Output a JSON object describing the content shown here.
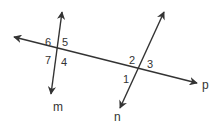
{
  "diagram": {
    "type": "transversal-lines",
    "lines": [
      {
        "name": "m",
        "label": "m"
      },
      {
        "name": "n",
        "label": "n"
      },
      {
        "name": "p",
        "label": "p"
      }
    ],
    "angles": {
      "a1": "1",
      "a2": "2",
      "a3": "3",
      "a4": "4",
      "a5": "5",
      "a6": "6",
      "a7": "7"
    },
    "colors": {
      "stroke": "#333333",
      "background": "#ffffff"
    }
  }
}
